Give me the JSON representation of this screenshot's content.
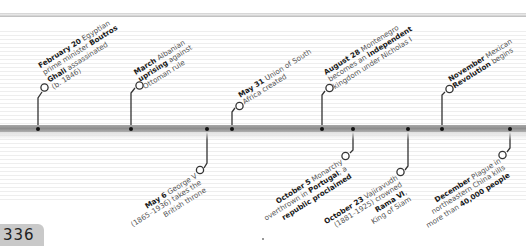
{
  "page": {
    "number": "336"
  },
  "colors": {
    "bar": "#9a9a9a",
    "line": "#333333",
    "text_bold": "#1a1a1a",
    "text": "#555555",
    "page_tab": "#c9c9c9"
  },
  "events_above": [
    {
      "date": "February 20",
      "parts": [
        " Egyptian",
        "prime minister ",
        "Boutros",
        "Ghali",
        " assassinated",
        "(b. 1846)"
      ],
      "x": 38
    },
    {
      "date": "March",
      "parts": [
        " Albanian",
        "uprising",
        " against",
        "Ottoman rule"
      ],
      "x": 131
    },
    {
      "date": "May 31",
      "parts": [
        " Union of South",
        "Africa created"
      ],
      "x": 232
    },
    {
      "date": "August 28",
      "parts": [
        " Montenegro",
        "becomes an ",
        "independent",
        "kingdom under Nicholas I"
      ],
      "x": 322
    },
    {
      "date": "November",
      "parts": [
        " Mexican",
        "Revolution",
        " begins"
      ],
      "x": 442
    }
  ],
  "events_below": [
    {
      "date": "May 6",
      "parts": [
        " George V",
        "(1865–1936) takes the",
        "British throne"
      ],
      "x": 207
    },
    {
      "date": "October 5",
      "parts": [
        " Monarchy",
        "overthrown in ",
        "Portugal",
        "; a",
        "republic proclaimed"
      ],
      "x": 353
    },
    {
      "date": "October 23",
      "parts": [
        " Vajiravudh",
        "(1881–1925) crowned",
        "Rama VI",
        ",",
        "King of Siam"
      ],
      "x": 408
    },
    {
      "date": "December",
      "parts": [
        " Plague in",
        "northeastern China kills",
        "more than ",
        "40,000 people"
      ],
      "x": 510
    }
  ]
}
